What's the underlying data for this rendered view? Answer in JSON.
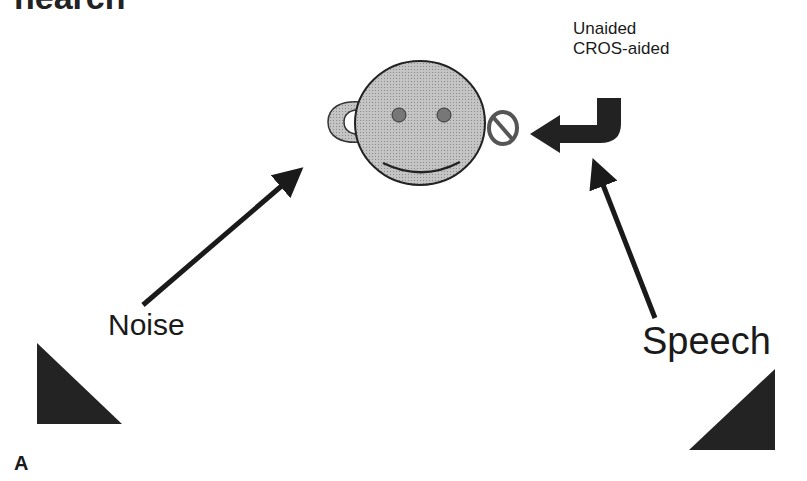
{
  "figure": {
    "clipped_header": "hearch",
    "panel_label": "A",
    "labels": {
      "noise": "Noise",
      "speech": "Speech",
      "legend_unaided": "Unaided",
      "legend_cros_aided": "CROS-aided"
    },
    "colors": {
      "face_fill": "#b8b8b8",
      "eye_fill": "#777777",
      "ink": "#1a1a1a",
      "speaker_fill": "#222222"
    },
    "icons": {
      "head": "smiley-face-icon",
      "left_ear_hearing_aid": "hearing-aid-icon",
      "right_ear_blocked": "no-symbol-icon",
      "cros_routing": "curved-arrow-icon",
      "noise_source": "speaker-triangle-icon",
      "speech_source": "speaker-triangle-icon"
    }
  }
}
